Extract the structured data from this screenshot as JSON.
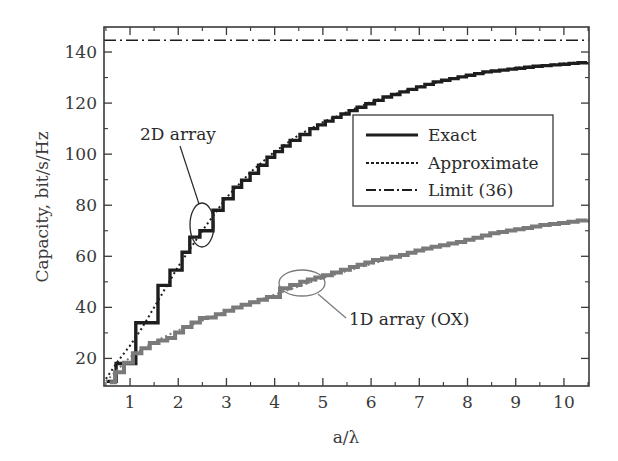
{
  "chart_data": {
    "type": "line",
    "title": "",
    "xlabel": "a/λ",
    "ylabel": "Capacity, bit/s/Hz",
    "xlim": [
      0.46,
      10.52
    ],
    "ylim": [
      9.2,
      149.8
    ],
    "xticks": [
      1,
      2,
      3,
      4,
      5,
      6,
      7,
      8,
      9,
      10
    ],
    "xticks_minor": [
      0.5,
      1.5,
      2.5,
      3.5,
      4.5,
      5.5,
      6.5,
      7.5,
      8.5,
      9.5,
      10.5
    ],
    "yticks": [
      20,
      40,
      60,
      80,
      100,
      120,
      140
    ],
    "yticks_minor": [
      30,
      50,
      70,
      90,
      110,
      130,
      150
    ],
    "grid": false,
    "legend": {
      "position": "upper-right-inside",
      "entries": [
        {
          "label": "Exact",
          "style": "solid"
        },
        {
          "label": "Approximate",
          "style": "dotted"
        },
        {
          "label": "Limit (36)",
          "style": "dashdot"
        }
      ]
    },
    "series": [
      {
        "name": "2D array — Exact",
        "style": "solid-step",
        "color": "#1e1e1e",
        "x": [
          0.52,
          0.71,
          1.0,
          1.12,
          1.41,
          1.58,
          1.83,
          2.08,
          2.24,
          2.45,
          2.72,
          3.14,
          3.49,
          3.84,
          4.32,
          4.73,
          5.21,
          5.71,
          6.25,
          7.29,
          8.32,
          9.36,
          10.48
        ],
        "y": [
          11,
          18,
          18,
          34,
          34,
          48.6,
          54.6,
          61.6,
          67.5,
          70,
          78,
          87,
          92.5,
          98.8,
          105.4,
          110,
          114.4,
          118.4,
          122.4,
          128.3,
          132.2,
          134.4,
          136.1
        ]
      },
      {
        "name": "2D array — Approximate",
        "style": "dotted",
        "color": "#1e1e1e",
        "x": [
          0.5,
          0.75,
          1.0,
          1.25,
          1.5,
          2.0,
          2.5,
          3.0,
          3.5,
          4.0,
          4.5,
          5.0,
          6.0,
          7.0,
          8.0,
          9.0,
          10.0,
          10.5
        ],
        "y": [
          12,
          19,
          25,
          32,
          40,
          56,
          70,
          83,
          93,
          101,
          107.5,
          112.5,
          120.5,
          126.5,
          130.8,
          133.8,
          135.5,
          136.2
        ]
      },
      {
        "name": "1D array (OX) — Exact",
        "style": "solid-step",
        "color": "#7a7a7a",
        "x": [
          0.58,
          0.69,
          1.06,
          1.41,
          1.77,
          2.1,
          2.45,
          2.6,
          3.14,
          3.84,
          4.11,
          4.53,
          5.0,
          5.56,
          6.04,
          6.6,
          7.08,
          7.78,
          8.47,
          9.51,
          10.48
        ],
        "y": [
          10.7,
          14.6,
          22,
          26,
          28,
          32.3,
          35.8,
          36,
          40,
          44,
          47.5,
          50,
          52.6,
          55.8,
          58.5,
          60.5,
          63.1,
          65.6,
          69,
          72.2,
          74.4
        ]
      },
      {
        "name": "1D array (OX) — Approximate",
        "style": "dotted",
        "color": "#7a7a7a",
        "x": [
          0.5,
          1.0,
          1.5,
          2.0,
          3.0,
          4.0,
          5.0,
          6.0,
          7.0,
          8.0,
          9.0,
          10.0,
          10.5
        ],
        "y": [
          11,
          20.5,
          26.5,
          31,
          38.5,
          45,
          51.5,
          57,
          62,
          66.5,
          70.5,
          73,
          74.5
        ]
      },
      {
        "name": "Limit (36)",
        "style": "dashdot",
        "color": "#1e1e1e",
        "x": [
          0.46,
          10.52
        ],
        "y": [
          144.6,
          144.6
        ]
      }
    ],
    "annotations": [
      {
        "text": "2D array",
        "ellipse_center": [
          2.5,
          70
        ],
        "points_to": "2D array curve"
      },
      {
        "text": "1D array (OX)",
        "ellipse_center": [
          4.55,
          49.5
        ],
        "points_to": "1D array curve"
      }
    ]
  }
}
